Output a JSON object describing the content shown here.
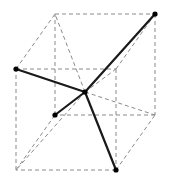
{
  "figure": {
    "canvas": {
      "width": 169,
      "height": 187,
      "background": "#ffffff"
    },
    "colors": {
      "cell_edge": "#8a8a8a",
      "bond": "#1a1a1a",
      "atom": "#000000",
      "background": "#ffffff"
    },
    "style": {
      "cell_edge_width": 1,
      "cell_edge_dash": "4 3",
      "bond_width": 2.2,
      "atom_radius": 2.6
    },
    "vertices": {
      "front_top_left": {
        "label": "A",
        "x": 16,
        "y": 69
      },
      "front_top_right": {
        "label": "B",
        "x": 116,
        "y": 69
      },
      "front_bottom_right": {
        "label": "C",
        "x": 116,
        "y": 170
      },
      "front_bottom_left": {
        "label": "D",
        "x": 16,
        "y": 170
      },
      "back_top_left": {
        "label": "E",
        "x": 55,
        "y": 14
      },
      "back_top_right": {
        "label": "F",
        "x": 155,
        "y": 14
      },
      "back_bottom_right": {
        "label": "G",
        "x": 155,
        "y": 115
      },
      "back_bottom_left": {
        "label": "H",
        "x": 55,
        "y": 115
      },
      "body_center": {
        "label": "O",
        "x": 85,
        "y": 92
      }
    },
    "cell_edges": [
      {
        "name": "front-top",
        "from": "front_top_left",
        "to": "front_top_right"
      },
      {
        "name": "front-right",
        "from": "front_top_right",
        "to": "front_bottom_right"
      },
      {
        "name": "front-bottom",
        "from": "front_bottom_right",
        "to": "front_bottom_left"
      },
      {
        "name": "front-left",
        "from": "front_bottom_left",
        "to": "front_top_left"
      },
      {
        "name": "back-top",
        "from": "back_top_left",
        "to": "back_top_right"
      },
      {
        "name": "back-right",
        "from": "back_top_right",
        "to": "back_bottom_right"
      },
      {
        "name": "back-bottom",
        "from": "back_bottom_right",
        "to": "back_bottom_left"
      },
      {
        "name": "back-left",
        "from": "back_bottom_left",
        "to": "back_top_left"
      },
      {
        "name": "depth-top-left",
        "from": "front_top_left",
        "to": "back_top_left"
      },
      {
        "name": "depth-top-right",
        "from": "front_top_right",
        "to": "back_top_right"
      },
      {
        "name": "depth-bottom-right",
        "from": "front_bottom_right",
        "to": "back_bottom_right"
      },
      {
        "name": "depth-bottom-left",
        "from": "front_bottom_left",
        "to": "back_bottom_left"
      }
    ],
    "center_guides": [
      {
        "name": "guide-center-to-back-top-left",
        "from": "body_center",
        "to": "back_top_left"
      },
      {
        "name": "guide-center-to-back-top-right",
        "from": "body_center",
        "to": "back_top_right"
      },
      {
        "name": "guide-center-to-back-bottom-right",
        "from": "body_center",
        "to": "back_bottom_right"
      },
      {
        "name": "guide-center-to-front-top-right",
        "from": "body_center",
        "to": "front_top_right"
      },
      {
        "name": "guide-center-to-front-bottom-left",
        "from": "body_center",
        "to": "front_bottom_left"
      },
      {
        "name": "guide-center-to-front-top-left",
        "from": "body_center",
        "to": "front_top_left"
      },
      {
        "name": "guide-center-to-back-bottom-left",
        "from": "body_center",
        "to": "back_bottom_left"
      },
      {
        "name": "guide-center-to-front-bottom-right",
        "from": "body_center",
        "to": "front_bottom_right"
      }
    ],
    "bonds": [
      {
        "name": "bond-center-to-front-top-left",
        "from": "body_center",
        "to": "front_top_left"
      },
      {
        "name": "bond-center-to-back-top-right",
        "from": "body_center",
        "to": "back_top_right"
      },
      {
        "name": "bond-center-to-back-bottom-left",
        "from": "body_center",
        "to": "back_bottom_left"
      },
      {
        "name": "bond-center-to-front-bottom-right",
        "from": "body_center",
        "to": "front_bottom_right"
      }
    ],
    "atoms": [
      {
        "name": "atom-front-top-left",
        "at": "front_top_left"
      },
      {
        "name": "atom-back-top-right",
        "at": "back_top_right"
      },
      {
        "name": "atom-back-bottom-left",
        "at": "back_bottom_left"
      },
      {
        "name": "atom-front-bottom-right",
        "at": "front_bottom_right"
      },
      {
        "name": "atom-body-center",
        "at": "body_center"
      }
    ]
  },
  "chart_data": {
    "type": "diagram",
    "xlabel": "",
    "ylabel": ""
  }
}
